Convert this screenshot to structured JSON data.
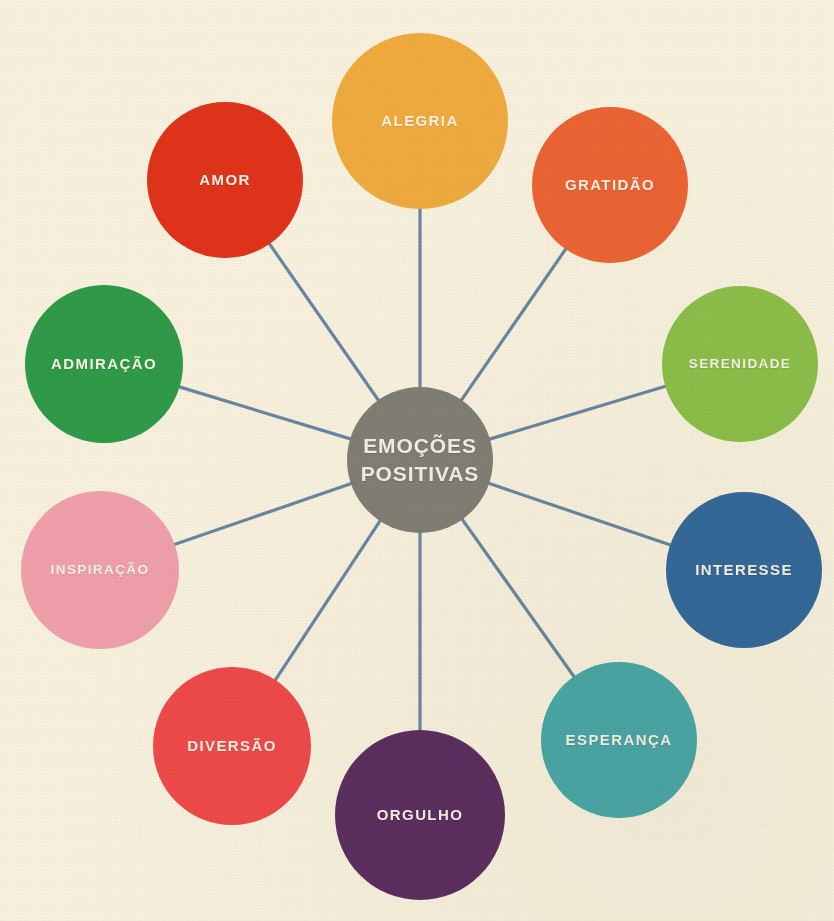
{
  "diagram": {
    "type": "radial-hub-and-spoke",
    "language": "pt-BR",
    "background_color": "#f7f1de",
    "connector_color": "#5c7f9e",
    "label_color": "#f7f2e6",
    "hub": {
      "line1": "EMOÇÕES",
      "line2": "POSITIVAS",
      "color": "#817f74",
      "cx": 420,
      "cy": 460,
      "r": 73
    },
    "nodes": [
      {
        "label": "ALEGRIA",
        "color": "#efab3e",
        "cx": 420,
        "cy": 121,
        "r": 88,
        "angle_deg": -90
      },
      {
        "label": "GRATIDÃO",
        "color": "#ec6433",
        "cx": 610,
        "cy": 185,
        "r": 78,
        "angle_deg": -54
      },
      {
        "label": "SERENIDADE",
        "color": "#8cbf4a",
        "cx": 740,
        "cy": 364,
        "r": 78,
        "angle_deg": -18
      },
      {
        "label": "INTERESSE",
        "color": "#346a9c",
        "cx": 744,
        "cy": 570,
        "r": 78,
        "angle_deg": 18
      },
      {
        "label": "ESPERANÇA",
        "color": "#4aa8a8",
        "cx": 619,
        "cy": 740,
        "r": 78,
        "angle_deg": 54
      },
      {
        "label": "ORGULHO",
        "color": "#5c2f60",
        "cx": 420,
        "cy": 815,
        "r": 85,
        "angle_deg": 90
      },
      {
        "label": "DIVERSÃO",
        "color": "#ef4a4a",
        "cx": 232,
        "cy": 746,
        "r": 79,
        "angle_deg": 126
      },
      {
        "label": "INSPIRAÇÃO",
        "color": "#efa0ac",
        "cx": 100,
        "cy": 570,
        "r": 79,
        "angle_deg": 162
      },
      {
        "label": "ADMIRAÇÃO",
        "color": "#2f9a48",
        "cx": 104,
        "cy": 364,
        "r": 79,
        "angle_deg": 198
      },
      {
        "label": "AMOR",
        "color": "#e0331b",
        "cx": 225,
        "cy": 180,
        "r": 78,
        "angle_deg": 234
      }
    ]
  }
}
